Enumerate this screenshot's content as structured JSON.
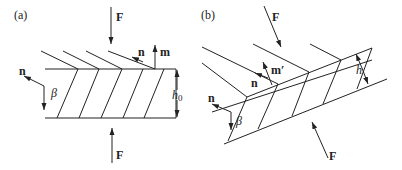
{
  "panels": [
    {
      "id": "a",
      "label": "(a)",
      "force_top": "F",
      "force_bottom": "F",
      "normal_left": "n",
      "normal_right": "n",
      "vector_m": "m",
      "angle": "β",
      "height_label": "h",
      "height_sub": "0"
    },
    {
      "id": "b",
      "label": "(b)",
      "force_top": "F",
      "force_bottom": "F",
      "normal_left": "n",
      "normal_right": "n",
      "vector_m": "m′",
      "angle": "β",
      "height_label": "h"
    }
  ]
}
